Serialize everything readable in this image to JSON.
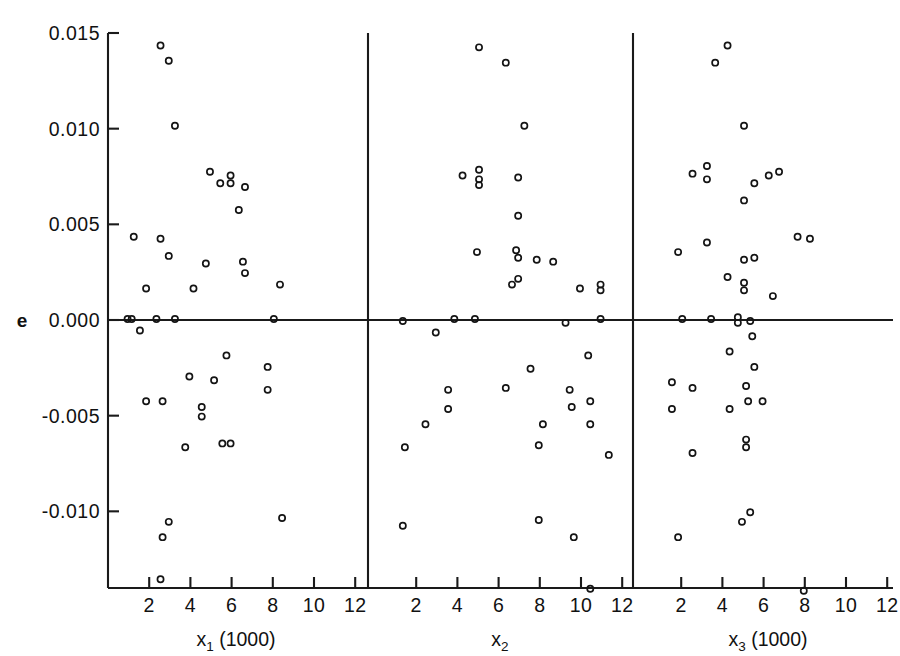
{
  "figure": {
    "ylabel": "e",
    "y_ticks": [
      "0.015",
      "0.010",
      "0.005",
      "0.000",
      "-0.005",
      "-0.010"
    ],
    "y_tick_values": [
      0.015,
      0.01,
      0.005,
      0.0,
      -0.005,
      -0.01
    ],
    "x_ticks": [
      "2",
      "4",
      "6",
      "8",
      "10",
      "12"
    ],
    "x_tick_values": [
      2,
      4,
      6,
      8,
      10,
      12
    ],
    "panels": [
      {
        "key": "x1",
        "title_main": "x",
        "title_sub": "1",
        "title_suffix": " (1000)"
      },
      {
        "key": "x2",
        "title_main": "x",
        "title_sub": "2",
        "title_suffix": ""
      },
      {
        "key": "x3",
        "title_main": "x",
        "title_sub": "3",
        "title_suffix": " (1000)"
      }
    ],
    "marker": {
      "shape": "open-circle",
      "radius": 3.1,
      "color": "#141414"
    },
    "background": "#ffffff",
    "line_color": "#1a1a1a"
  },
  "chart_data": [
    {
      "type": "scatter",
      "title": "",
      "xlabel": "x1 (1000)",
      "ylabel": "e",
      "xlim": [
        0.3,
        13.2
      ],
      "ylim": [
        -0.0152,
        0.0155
      ],
      "grid": false,
      "legend": "none",
      "points": [
        [
          2.55,
          0.01435
        ],
        [
          2.95,
          0.01355
        ],
        [
          3.25,
          0.01015
        ],
        [
          4.95,
          0.00775
        ],
        [
          5.45,
          0.00715
        ],
        [
          5.95,
          0.00755
        ],
        [
          5.95,
          0.00715
        ],
        [
          6.65,
          0.00695
        ],
        [
          6.35,
          0.00575
        ],
        [
          1.25,
          0.00435
        ],
        [
          2.55,
          0.00425
        ],
        [
          2.95,
          0.00335
        ],
        [
          4.75,
          0.00295
        ],
        [
          6.55,
          0.00305
        ],
        [
          6.65,
          0.00245
        ],
        [
          1.85,
          0.00165
        ],
        [
          4.15,
          0.00165
        ],
        [
          8.35,
          0.00185
        ],
        [
          0.95,
          5e-05
        ],
        [
          1.15,
          5e-05
        ],
        [
          2.35,
          5e-05
        ],
        [
          3.25,
          5e-05
        ],
        [
          8.05,
          5e-05
        ],
        [
          1.55,
          -0.00055
        ],
        [
          5.75,
          -0.00185
        ],
        [
          7.75,
          -0.00245
        ],
        [
          3.95,
          -0.00295
        ],
        [
          5.15,
          -0.00315
        ],
        [
          7.75,
          -0.00365
        ],
        [
          1.85,
          -0.00425
        ],
        [
          2.65,
          -0.00425
        ],
        [
          4.55,
          -0.00455
        ],
        [
          4.55,
          -0.00505
        ],
        [
          3.75,
          -0.00665
        ],
        [
          5.55,
          -0.00645
        ],
        [
          5.95,
          -0.00645
        ],
        [
          2.95,
          -0.01055
        ],
        [
          2.65,
          -0.01135
        ],
        [
          8.45,
          -0.01035
        ],
        [
          2.55,
          -0.01355
        ]
      ]
    },
    {
      "type": "scatter",
      "title": "",
      "xlabel": "x2",
      "ylabel": "e",
      "xlim": [
        0.3,
        13.2
      ],
      "ylim": [
        -0.0152,
        0.0155
      ],
      "grid": false,
      "legend": "none",
      "points": [
        [
          5.05,
          0.01425
        ],
        [
          6.35,
          0.01345
        ],
        [
          7.25,
          0.01015
        ],
        [
          4.25,
          0.00755
        ],
        [
          5.05,
          0.00785
        ],
        [
          5.05,
          0.00735
        ],
        [
          5.05,
          0.00705
        ],
        [
          6.95,
          0.00745
        ],
        [
          6.95,
          0.00545
        ],
        [
          4.95,
          0.00355
        ],
        [
          6.85,
          0.00365
        ],
        [
          6.95,
          0.00325
        ],
        [
          7.85,
          0.00315
        ],
        [
          8.65,
          0.00305
        ],
        [
          6.95,
          0.00215
        ],
        [
          6.65,
          0.00185
        ],
        [
          9.95,
          0.00165
        ],
        [
          10.95,
          0.00185
        ],
        [
          10.95,
          0.00155
        ],
        [
          1.35,
          -5e-05
        ],
        [
          3.85,
          5e-05
        ],
        [
          4.85,
          5e-05
        ],
        [
          9.25,
          -0.00015
        ],
        [
          10.95,
          5e-05
        ],
        [
          2.95,
          -0.00065
        ],
        [
          10.35,
          -0.00185
        ],
        [
          7.55,
          -0.00255
        ],
        [
          3.55,
          -0.00365
        ],
        [
          6.35,
          -0.00355
        ],
        [
          9.45,
          -0.00365
        ],
        [
          10.45,
          -0.00425
        ],
        [
          9.55,
          -0.00455
        ],
        [
          3.55,
          -0.00465
        ],
        [
          2.45,
          -0.00545
        ],
        [
          8.15,
          -0.00545
        ],
        [
          10.45,
          -0.00545
        ],
        [
          1.45,
          -0.00665
        ],
        [
          7.95,
          -0.00655
        ],
        [
          11.35,
          -0.00705
        ],
        [
          1.35,
          -0.01075
        ],
        [
          7.95,
          -0.01045
        ],
        [
          9.65,
          -0.01135
        ],
        [
          10.45,
          -0.01405
        ]
      ]
    },
    {
      "type": "scatter",
      "title": "",
      "xlabel": "x3 (1000)",
      "ylabel": "e",
      "xlim": [
        0.3,
        13.2
      ],
      "ylim": [
        -0.0152,
        0.0155
      ],
      "grid": false,
      "legend": "none",
      "points": [
        [
          4.25,
          0.01435
        ],
        [
          3.65,
          0.01345
        ],
        [
          5.05,
          0.01015
        ],
        [
          2.55,
          0.00765
        ],
        [
          3.25,
          0.00805
        ],
        [
          3.25,
          0.00735
        ],
        [
          6.25,
          0.00755
        ],
        [
          5.55,
          0.00715
        ],
        [
          6.75,
          0.00775
        ],
        [
          5.05,
          0.00625
        ],
        [
          1.85,
          0.00355
        ],
        [
          3.25,
          0.00405
        ],
        [
          5.05,
          0.00315
        ],
        [
          5.55,
          0.00325
        ],
        [
          7.65,
          0.00435
        ],
        [
          8.25,
          0.00425
        ],
        [
          4.25,
          0.00225
        ],
        [
          5.05,
          0.00195
        ],
        [
          5.05,
          0.00155
        ],
        [
          6.45,
          0.00125
        ],
        [
          2.05,
          5e-05
        ],
        [
          3.45,
          5e-05
        ],
        [
          4.75,
          0.00015
        ],
        [
          4.75,
          -0.00015
        ],
        [
          5.35,
          -5e-05
        ],
        [
          5.45,
          -0.00085
        ],
        [
          4.35,
          -0.00165
        ],
        [
          5.55,
          -0.00245
        ],
        [
          1.55,
          -0.00325
        ],
        [
          2.55,
          -0.00355
        ],
        [
          5.15,
          -0.00345
        ],
        [
          5.25,
          -0.00425
        ],
        [
          5.95,
          -0.00425
        ],
        [
          4.35,
          -0.00465
        ],
        [
          1.55,
          -0.00465
        ],
        [
          5.15,
          -0.00625
        ],
        [
          5.15,
          -0.00665
        ],
        [
          2.55,
          -0.00695
        ],
        [
          4.95,
          -0.01055
        ],
        [
          5.35,
          -0.01005
        ],
        [
          1.85,
          -0.01135
        ],
        [
          7.95,
          -0.01415
        ]
      ]
    }
  ]
}
